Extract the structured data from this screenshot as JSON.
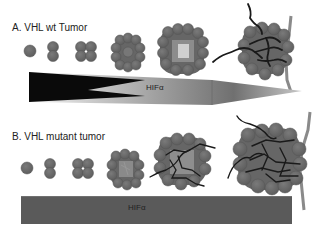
{
  "panel_a": {
    "title": "A. VHL wt Tumor",
    "hif_label": "HIFα",
    "hif_shape": "tapered-gradient",
    "stages": [
      "single-cell",
      "two-cell",
      "four-cell",
      "small-cluster",
      "cluster-with-necrotic-core",
      "vascularized-cluster"
    ]
  },
  "panel_b": {
    "title": "B. VHL mutant tumor",
    "hif_label": "HIFα",
    "hif_shape": "constant-bar",
    "stages": [
      "single-cell",
      "two-cell",
      "four-cell",
      "small-cluster-with-vessels",
      "vascularized-cluster",
      "large-vascularized-cluster"
    ]
  },
  "colors": {
    "cell_fill": "#6e6e6e",
    "cell_stroke": "#555555",
    "necrotic_core": "#c8c8c8",
    "vessel": "#1a1a1a",
    "large_vessel": "#8a8a8a",
    "bar_fill": "#5a5a5a"
  }
}
